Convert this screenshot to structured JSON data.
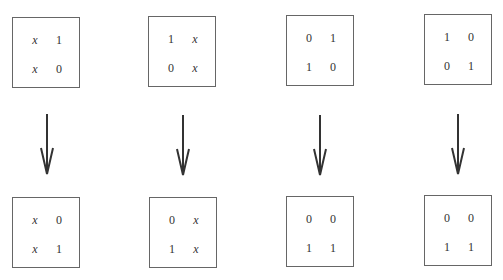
{
  "diagram": {
    "columns": [
      {
        "top": {
          "cells": [
            [
              "x",
              "1"
            ],
            [
              "x",
              "0"
            ]
          ]
        },
        "bottom": {
          "cells": [
            [
              "x",
              "0"
            ],
            [
              "x",
              "1"
            ]
          ]
        }
      },
      {
        "top": {
          "cells": [
            [
              "1",
              "x"
            ],
            [
              "0",
              "x"
            ]
          ]
        },
        "bottom": {
          "cells": [
            [
              "0",
              "x"
            ],
            [
              "1",
              "x"
            ]
          ]
        }
      },
      {
        "top": {
          "cells": [
            [
              "0",
              "1"
            ],
            [
              "1",
              "0"
            ]
          ]
        },
        "bottom": {
          "cells": [
            [
              "0",
              "0"
            ],
            [
              "1",
              "1"
            ]
          ]
        }
      },
      {
        "top": {
          "cells": [
            [
              "1",
              "0"
            ],
            [
              "0",
              "1"
            ]
          ]
        },
        "bottom": {
          "cells": [
            [
              "0",
              "0"
            ],
            [
              "1",
              "1"
            ]
          ]
        }
      }
    ],
    "arrow_icon": "arrow-down-icon",
    "colors": {
      "border": "#666666",
      "arrow": "#333333",
      "text": "#333333"
    }
  }
}
